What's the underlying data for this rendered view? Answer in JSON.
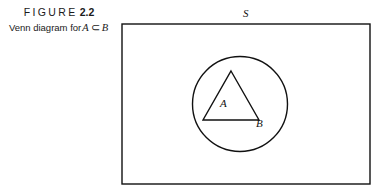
{
  "figure": {
    "title_word": "FIGURE",
    "title_number": "2.2",
    "caption_prefix": "Venn diagram for",
    "caption_set_a": "A",
    "caption_operator": "⊂",
    "caption_set_b": "B"
  },
  "diagram": {
    "type": "venn",
    "labels": {
      "universal_set": "S",
      "inner_set": "A",
      "outer_set": "B"
    },
    "shapes": {
      "rectangle": {
        "x": 122,
        "y": 24,
        "width": 248,
        "height": 160,
        "label": "S"
      },
      "circle": {
        "cx": 240,
        "cy": 104,
        "r": 47.5,
        "label": "B"
      },
      "triangle": {
        "apex_x": 231,
        "apex_y": 71,
        "left_x": 203,
        "left_y": 120,
        "right_x": 259,
        "right_y": 120,
        "label": "A"
      }
    },
    "colors": {
      "stroke": "#111111",
      "background": "#ffffff"
    },
    "stroke_width": 1.3
  }
}
